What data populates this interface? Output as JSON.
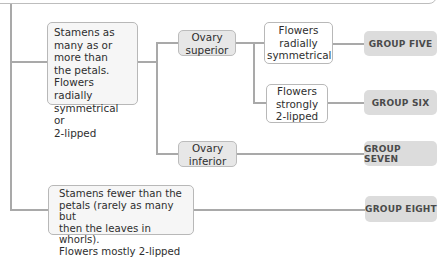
{
  "diagram": {
    "type": "identification-key",
    "nodes": {
      "stamens_many": "Stamens as many as or more than the petals. Flowers radially symmetrical or 2-lipped",
      "ovary_superior": "Ovary superior",
      "flowers_radial": "Flowers radially symmetrical",
      "flowers_2lipped": "Flowers strongly 2-lipped",
      "ovary_inferior": "Ovary inferior",
      "stamens_fewer": "Stamens fewer than the petals (rarely as many but then the leaves in whorls). Flowers mostly 2-lipped"
    },
    "lines": {
      "stamens_many": [
        "Stamens as",
        "many as or",
        "more than",
        "the petals.",
        "Flowers radially",
        "symmetrical or",
        "2-lipped"
      ],
      "ovary_superior": [
        "Ovary",
        "superior"
      ],
      "flowers_radial": [
        "Flowers",
        "radially",
        "symmetrical"
      ],
      "flowers_2lipped": [
        "Flowers",
        "strongly",
        "2-lipped"
      ],
      "ovary_inferior": [
        "Ovary",
        "inferior"
      ],
      "stamens_fewer": [
        "Stamens fewer than the",
        "petals (rarely as many but",
        "then the leaves in whorls).",
        "Flowers mostly 2-lipped"
      ]
    },
    "groups": {
      "five": "GROUP FIVE",
      "six": "GROUP SIX",
      "seven": "GROUP SEVEN",
      "eight": "GROUP EIGHT"
    },
    "colors": {
      "line": "#a9a9a9",
      "group_fill": "#dcdcdc",
      "ovary_fill": "#e7e7e7",
      "text": "#2e2e2e"
    }
  }
}
